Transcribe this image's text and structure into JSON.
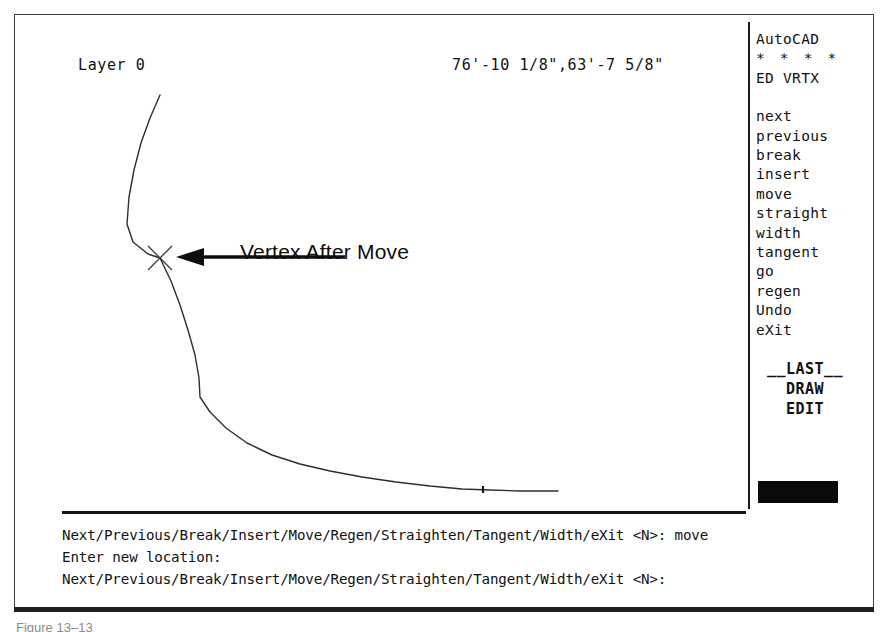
{
  "screen": {
    "layer_indicator": "Layer 0",
    "coordinate_readout": "76'-10 1/8\",63'-7 5/8\"",
    "annotation_label": "Vertex After Move",
    "background_color": "#ffffff",
    "foreground_color": "#111111"
  },
  "side_menu": {
    "title": "AutoCAD",
    "stars": "* * * *",
    "mode": "ED VRTX",
    "items": [
      {
        "label": "next"
      },
      {
        "label": "previous"
      },
      {
        "label": "break"
      },
      {
        "label": "insert"
      },
      {
        "label": "move"
      },
      {
        "label": "straight"
      },
      {
        "label": "width"
      },
      {
        "label": "tangent"
      },
      {
        "label": "go"
      },
      {
        "label": "regen"
      },
      {
        "label": "Undo"
      },
      {
        "label": "eXit"
      }
    ],
    "footer": [
      {
        "label": "__LAST__"
      },
      {
        "label": "DRAW"
      },
      {
        "label": "EDIT"
      }
    ],
    "highlight_bar_color": "#0a0a0a"
  },
  "command_area": {
    "lines": [
      "Next/Previous/Break/Insert/Move/Regen/Straighten/Tangent/Width/eXit <N>: move",
      "Enter new location:",
      "Next/Previous/Break/Insert/Move/Regen/Straighten/Tangent/Width/eXit <N>:"
    ]
  },
  "drawing": {
    "polyline_color": "#2e2e2e",
    "vertex_marker": "x-marker",
    "vertex_marker_x": 160,
    "vertex_marker_y": 258,
    "polyline_points": "160,95 150,118 141,143 134,170 129,197 127,224 133,242 148,254 160,258 171,281 180,305 188,330 195,355 199,378 200,397 210,412 226,428 247,443 272,455 300,464 330,471 362,477 396,482 430,486 462,489 490,490 520,491 558,491",
    "arrow_from_x": 345,
    "arrow_to_x": 176,
    "arrow_y": 257
  },
  "caption": {
    "text": "Figure 13–13"
  }
}
